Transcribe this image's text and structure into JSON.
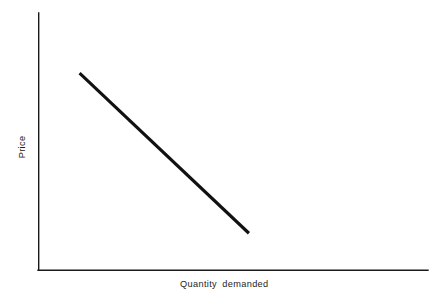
{
  "chart_data": {
    "type": "line",
    "title": "",
    "subtitle": "",
    "xlabel": "Quantity demanded",
    "ylabel": "Price",
    "xticks": [],
    "yticks": [],
    "grid": false,
    "legend": null,
    "annotations": [],
    "axis_color": "#1a1a1a",
    "line_color": "#111111",
    "background": "#ffffff",
    "series": [
      {
        "name": "Demand curve",
        "x": [
          0.105,
          0.54
        ],
        "y": [
          0.766,
          0.144
        ],
        "description": "Downward-sloping straight demand curve"
      }
    ],
    "xlim": [
      0,
      1
    ],
    "ylim": [
      0,
      1
    ]
  },
  "figure": {
    "xlabel": "Quantity demanded",
    "ylabel": "Price"
  }
}
